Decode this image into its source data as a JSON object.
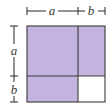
{
  "diagram": {
    "labels": {
      "top_a": "a",
      "top_b": "b",
      "left_a": "a",
      "left_b": "b"
    },
    "regions": [
      {
        "name": "a-squared",
        "dims": "a × a",
        "shaded": true
      },
      {
        "name": "ab-right",
        "dims": "b × a",
        "shaded": true
      },
      {
        "name": "ab-bottom",
        "dims": "a × b",
        "shaded": true
      },
      {
        "name": "b-squared",
        "dims": "b × b",
        "shaded": false
      }
    ],
    "colors": {
      "shade": "#c3b5e0",
      "unshaded": "#ffffff",
      "line": "#3a3a3a"
    }
  }
}
